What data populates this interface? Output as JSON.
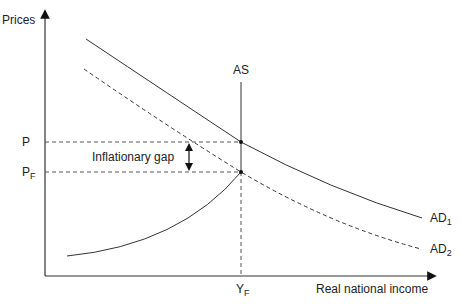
{
  "diagram": {
    "axes": {
      "y_label": "Prices",
      "x_label": "Real national income"
    },
    "curves": [
      {
        "name": "AD1",
        "label": "AD",
        "sub": "1",
        "style": "solid"
      },
      {
        "name": "AD2",
        "label": "AD",
        "sub": "2",
        "style": "dashed"
      },
      {
        "name": "AS",
        "label": "AS",
        "style": "solid"
      }
    ],
    "price_levels": [
      {
        "label": "P",
        "sub": ""
      },
      {
        "label": "P",
        "sub": "F"
      }
    ],
    "income_levels": [
      {
        "label": "Y",
        "sub": "F"
      }
    ],
    "annotation": "Inflationary gap",
    "colors": {
      "line": "#333333",
      "text": "#222222"
    }
  }
}
